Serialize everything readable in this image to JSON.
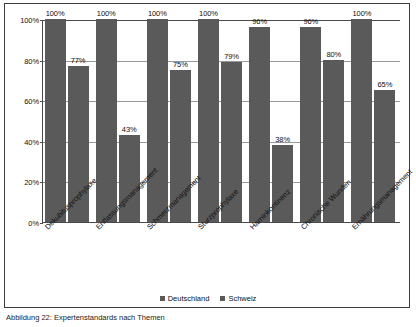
{
  "chart_data": {
    "type": "bar",
    "title": "",
    "subtitle": "",
    "xlabel": "",
    "ylabel": "",
    "ylim": [
      0,
      100
    ],
    "grid": true,
    "legend_position": "bottom",
    "y_ticks": [
      "0%",
      "20%",
      "40%",
      "60%",
      "80%",
      "100%"
    ],
    "y_tick_values": [
      0,
      20,
      40,
      60,
      80,
      100
    ],
    "categories": [
      "Dekubitusprophylaxe",
      "Entlassungsmanagement",
      "Schmerzmanagement",
      "Sturzprophylaxe",
      "Harninkontinenz",
      "Chronische Wunden",
      "Ernährungsmanagement"
    ],
    "series": [
      {
        "name": "Deutschland",
        "color": "#5a5a5a",
        "values": [
          100,
          100,
          100,
          100,
          96,
          96,
          100
        ],
        "labels": [
          "100%",
          "100%",
          "100%",
          "100%",
          "96%",
          "96%",
          "100%"
        ]
      },
      {
        "name": "Schweiz",
        "color": "#5a5a5a",
        "values": [
          77,
          43,
          75,
          79,
          38,
          80,
          65
        ],
        "labels": [
          "77%",
          "43%",
          "75%",
          "79%",
          "38%",
          "80%",
          "65%"
        ]
      }
    ]
  },
  "legend": {
    "entries": [
      {
        "label": "Deutschland"
      },
      {
        "label": "Schweiz"
      }
    ]
  },
  "caption": {
    "text": "Abbildung 22: Expertenstandards nach Themen"
  }
}
